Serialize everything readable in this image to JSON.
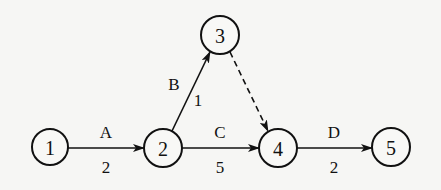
{
  "diagram": {
    "type": "activity-on-arrow network",
    "nodes": [
      {
        "id": "1",
        "label": "1",
        "x": 50,
        "y": 147
      },
      {
        "id": "2",
        "label": "2",
        "x": 163,
        "y": 148
      },
      {
        "id": "3",
        "label": "3",
        "x": 220,
        "y": 35
      },
      {
        "id": "4",
        "label": "4",
        "x": 278,
        "y": 148
      },
      {
        "id": "5",
        "label": "5",
        "x": 391,
        "y": 147
      }
    ],
    "edges": [
      {
        "from": "1",
        "to": "2",
        "activity": "A",
        "duration": "2",
        "style": "solid"
      },
      {
        "from": "2",
        "to": "3",
        "activity": "B",
        "duration": "1",
        "style": "solid"
      },
      {
        "from": "2",
        "to": "4",
        "activity": "C",
        "duration": "5",
        "style": "solid"
      },
      {
        "from": "3",
        "to": "4",
        "activity": "",
        "duration": "",
        "style": "dashed"
      },
      {
        "from": "4",
        "to": "5",
        "activity": "D",
        "duration": "2",
        "style": "solid"
      }
    ]
  }
}
